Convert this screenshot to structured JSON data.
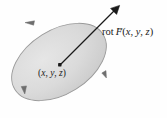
{
  "figure": {
    "name": "curl-of-vector-field-diagram",
    "background_color": "#fefefe",
    "width": 167,
    "height": 118
  },
  "surface": {
    "name": "oriented-disk",
    "shape": "ellipse",
    "center_x": 59,
    "center_y": 62,
    "radius_x": 52,
    "radius_y": 32,
    "rotation_deg": -32,
    "fill_color": "#d9d9d9",
    "fill_color_light": "#e4e4e4",
    "fill_color_dark": "#c9c9c9",
    "outline_color": "#8c8c8c"
  },
  "orientation_arrows": {
    "name": "circulation-arrowheads",
    "color": "#6e6e6e",
    "direction": "counterclockwise",
    "count": 3
  },
  "center_point": {
    "name": "point-xyz",
    "x": 60,
    "y": 65,
    "color": "#1a1a1a",
    "label_prefix": "(",
    "label_x": "x",
    "label_y": "y",
    "label_z": "z",
    "label_suffix": ")",
    "comma": ", ",
    "label_full": "(x, y, z)"
  },
  "curl_vector": {
    "name": "curl-vector-arrow",
    "color": "#1a1a1a",
    "start_x": 60,
    "start_y": 65,
    "end_x": 119,
    "end_y": 6,
    "label_operator": "rot",
    "label_field": "F",
    "vector_accent": "→",
    "label_open_paren": "(",
    "label_arg_x": "x",
    "label_arg_y": "y",
    "label_arg_z": "z",
    "label_close_paren": ")",
    "label_comma": ", ",
    "label_full": "rot F(x, y, z)"
  }
}
